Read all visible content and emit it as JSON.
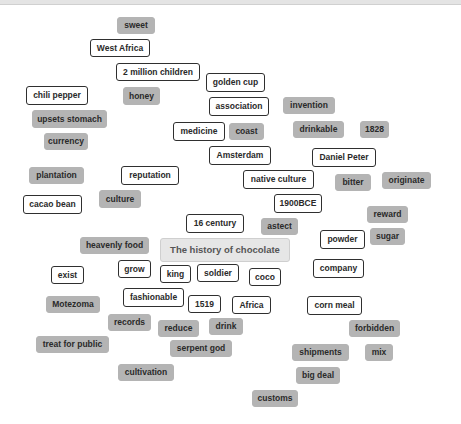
{
  "topbar": {
    "text": ""
  },
  "central_topic": {
    "label": "The history of chocolate",
    "x": 160,
    "y": 238,
    "w": 130,
    "h": 24
  },
  "chips": [
    {
      "label": "sweet",
      "style": "filled",
      "x": 117,
      "y": 17,
      "w": 38,
      "h": 17
    },
    {
      "label": "West Africa",
      "style": "outline",
      "x": 90,
      "y": 39,
      "w": 60,
      "h": 18
    },
    {
      "label": "2 million children",
      "style": "outline",
      "x": 116,
      "y": 63,
      "w": 84,
      "h": 18
    },
    {
      "label": "golden cup",
      "style": "outline",
      "x": 206,
      "y": 73,
      "w": 59,
      "h": 19
    },
    {
      "label": "chili pepper",
      "style": "outline",
      "x": 26,
      "y": 86,
      "w": 62,
      "h": 19
    },
    {
      "label": "honey",
      "style": "filled",
      "x": 123,
      "y": 87,
      "w": 37,
      "h": 18
    },
    {
      "label": "association",
      "style": "outline",
      "x": 209,
      "y": 97,
      "w": 60,
      "h": 19
    },
    {
      "label": "invention",
      "style": "filled",
      "x": 283,
      "y": 97,
      "w": 52,
      "h": 17
    },
    {
      "label": "upsets stomach",
      "style": "filled",
      "x": 32,
      "y": 110,
      "w": 75,
      "h": 18
    },
    {
      "label": "medicine",
      "style": "outline",
      "x": 173,
      "y": 122,
      "w": 52,
      "h": 19
    },
    {
      "label": "coast",
      "style": "filled",
      "x": 229,
      "y": 123,
      "w": 35,
      "h": 17
    },
    {
      "label": "drinkable",
      "style": "filled",
      "x": 293,
      "y": 121,
      "w": 51,
      "h": 17
    },
    {
      "label": "1828",
      "style": "filled",
      "x": 360,
      "y": 121,
      "w": 29,
      "h": 17
    },
    {
      "label": "currency",
      "style": "filled",
      "x": 44,
      "y": 133,
      "w": 44,
      "h": 17
    },
    {
      "label": "Amsterdam",
      "style": "outline",
      "x": 209,
      "y": 146,
      "w": 62,
      "h": 19
    },
    {
      "label": "Daniel Peter",
      "style": "outline",
      "x": 312,
      "y": 148,
      "w": 64,
      "h": 19
    },
    {
      "label": "plantation",
      "style": "filled",
      "x": 29,
      "y": 167,
      "w": 55,
      "h": 17
    },
    {
      "label": "reputation",
      "style": "outline",
      "x": 121,
      "y": 166,
      "w": 58,
      "h": 19
    },
    {
      "label": "native culture",
      "style": "outline",
      "x": 243,
      "y": 170,
      "w": 71,
      "h": 19
    },
    {
      "label": "bitter",
      "style": "filled",
      "x": 335,
      "y": 174,
      "w": 36,
      "h": 17
    },
    {
      "label": "originate",
      "style": "filled",
      "x": 382,
      "y": 172,
      "w": 49,
      "h": 17
    },
    {
      "label": "cacao bean",
      "style": "outline",
      "x": 23,
      "y": 195,
      "w": 59,
      "h": 19
    },
    {
      "label": "culture",
      "style": "filled",
      "x": 99,
      "y": 190,
      "w": 42,
      "h": 18
    },
    {
      "label": "1900BCE",
      "style": "outline",
      "x": 274,
      "y": 194,
      "w": 48,
      "h": 19
    },
    {
      "label": "reward",
      "style": "filled",
      "x": 367,
      "y": 206,
      "w": 41,
      "h": 17
    },
    {
      "label": "16 century",
      "style": "outline",
      "x": 186,
      "y": 214,
      "w": 58,
      "h": 19
    },
    {
      "label": "astect",
      "style": "filled",
      "x": 261,
      "y": 218,
      "w": 37,
      "h": 17
    },
    {
      "label": "powder",
      "style": "outline",
      "x": 320,
      "y": 230,
      "w": 45,
      "h": 19
    },
    {
      "label": "sugar",
      "style": "filled",
      "x": 370,
      "y": 228,
      "w": 35,
      "h": 17
    },
    {
      "label": "heavenly food",
      "style": "filled",
      "x": 80,
      "y": 237,
      "w": 69,
      "h": 17
    },
    {
      "label": "grow",
      "style": "outline",
      "x": 118,
      "y": 260,
      "w": 33,
      "h": 18
    },
    {
      "label": "exist",
      "style": "outline",
      "x": 51,
      "y": 266,
      "w": 33,
      "h": 18
    },
    {
      "label": "king",
      "style": "outline",
      "x": 160,
      "y": 265,
      "w": 31,
      "h": 18
    },
    {
      "label": "soldier",
      "style": "outline",
      "x": 197,
      "y": 264,
      "w": 42,
      "h": 18
    },
    {
      "label": "coco",
      "style": "outline",
      "x": 249,
      "y": 268,
      "w": 32,
      "h": 18
    },
    {
      "label": "company",
      "style": "outline",
      "x": 313,
      "y": 259,
      "w": 51,
      "h": 19
    },
    {
      "label": "fashionable",
      "style": "outline",
      "x": 123,
      "y": 288,
      "w": 61,
      "h": 19
    },
    {
      "label": "1519",
      "style": "outline",
      "x": 188,
      "y": 295,
      "w": 33,
      "h": 18
    },
    {
      "label": "Africa",
      "style": "outline",
      "x": 232,
      "y": 296,
      "w": 39,
      "h": 18
    },
    {
      "label": "corn meal",
      "style": "outline",
      "x": 307,
      "y": 296,
      "w": 55,
      "h": 19
    },
    {
      "label": "Motezoma",
      "style": "filled",
      "x": 46,
      "y": 296,
      "w": 54,
      "h": 17
    },
    {
      "label": "records",
      "style": "filled",
      "x": 108,
      "y": 314,
      "w": 43,
      "h": 17
    },
    {
      "label": "reduce",
      "style": "filled",
      "x": 158,
      "y": 320,
      "w": 41,
      "h": 17
    },
    {
      "label": "drink",
      "style": "filled",
      "x": 209,
      "y": 318,
      "w": 34,
      "h": 17
    },
    {
      "label": "forbidden",
      "style": "filled",
      "x": 349,
      "y": 320,
      "w": 51,
      "h": 17
    },
    {
      "label": "treat for public",
      "style": "filled",
      "x": 36,
      "y": 336,
      "w": 73,
      "h": 17
    },
    {
      "label": "serpent god",
      "style": "filled",
      "x": 170,
      "y": 340,
      "w": 62,
      "h": 17
    },
    {
      "label": "shipments",
      "style": "filled",
      "x": 292,
      "y": 344,
      "w": 57,
      "h": 17
    },
    {
      "label": "mix",
      "style": "filled",
      "x": 365,
      "y": 344,
      "w": 28,
      "h": 17
    },
    {
      "label": "cultivation",
      "style": "filled",
      "x": 118,
      "y": 364,
      "w": 56,
      "h": 17
    },
    {
      "label": "big deal",
      "style": "filled",
      "x": 296,
      "y": 367,
      "w": 44,
      "h": 17
    },
    {
      "label": "customs",
      "style": "filled",
      "x": 252,
      "y": 390,
      "w": 46,
      "h": 17
    }
  ],
  "colors": {
    "filled_chip": "#b4b4b4",
    "outline_chip_border": "#2f2f2f",
    "central_bg": "#e6e6e6",
    "text": "#2a2a2a"
  }
}
